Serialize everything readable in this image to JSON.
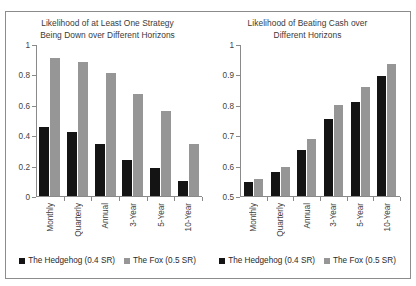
{
  "figure": {
    "panels": [
      "left",
      "right"
    ],
    "border_color": "#8c8c8c",
    "background": "#ffffff"
  },
  "legend": {
    "hedgehog_label": "The Hedgehog (0.4 SR)",
    "fox_label": "The Fox (0.5 SR)",
    "hedgehog_color": "#141414",
    "fox_color": "#969696"
  },
  "chart_data": [
    {
      "type": "bar",
      "panel": "left",
      "title": "Likelihood of at Least One Strategy Being Down over Different Horizons",
      "title_line1": "Likelihood of at Least One Strategy",
      "title_line2": "Being Down over Different Horizons",
      "xlabel": "",
      "ylabel": "",
      "ylim": [
        0,
        1
      ],
      "yticks": [
        0,
        0.2,
        0.4,
        0.6,
        0.8,
        1
      ],
      "ytick_labels": [
        "0",
        "0.2",
        "0.4",
        "0.6",
        "0.8",
        "1"
      ],
      "grid": false,
      "legend_position": "bottom-center",
      "categories": [
        "Monthly",
        "Quarterly",
        "Annual",
        "3-Year",
        "5-Year",
        "10-Year"
      ],
      "series": [
        {
          "name": "The Hedgehog (0.4 SR)",
          "color": "#141414",
          "values": [
            0.455,
            0.42,
            0.34,
            0.24,
            0.185,
            0.1
          ]
        },
        {
          "name": "The Fox (0.5 SR)",
          "color": "#969696",
          "values": [
            0.91,
            0.88,
            0.81,
            0.67,
            0.56,
            0.345
          ]
        }
      ]
    },
    {
      "type": "bar",
      "panel": "right",
      "title": "Likelihood of Beating Cash over Different Horizons",
      "title_line1": "Likelihood of Beating Cash over",
      "title_line2": "Different Horizons",
      "xlabel": "",
      "ylabel": "",
      "ylim": [
        0.5,
        1
      ],
      "yticks": [
        0.5,
        0.6,
        0.7,
        0.8,
        0.9,
        1
      ],
      "ytick_labels": [
        "0.5",
        "0.6",
        "0.7",
        "0.8",
        "0.9",
        "1"
      ],
      "grid": false,
      "legend_position": "bottom-center",
      "categories": [
        "Monthly",
        "Quarterly",
        "Annual",
        "3-Year",
        "5-Year",
        "10-Year"
      ],
      "series": [
        {
          "name": "The Hedgehog (0.4 SR)",
          "color": "#141414",
          "values": [
            0.545,
            0.578,
            0.653,
            0.753,
            0.81,
            0.895
          ]
        },
        {
          "name": "The Fox (0.5 SR)",
          "color": "#969696",
          "values": [
            0.555,
            0.597,
            0.687,
            0.8,
            0.858,
            0.935
          ]
        }
      ]
    }
  ]
}
